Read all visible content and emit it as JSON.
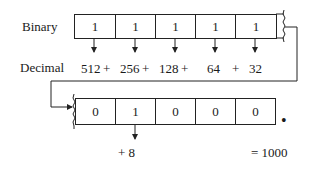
{
  "diagram": {
    "labels": {
      "binary": "Binary",
      "decimal": "Decimal"
    },
    "top_row": {
      "bits": [
        "1",
        "1",
        "1",
        "1",
        "1"
      ],
      "values": [
        "512",
        "+",
        "256",
        "+",
        "128",
        "+",
        "64",
        "+",
        "32"
      ]
    },
    "bottom_row": {
      "bits": [
        "0",
        "1",
        "0",
        "0",
        "0"
      ],
      "values": [
        "+ 8"
      ]
    },
    "binary_point": "•",
    "result": "= 1000"
  }
}
